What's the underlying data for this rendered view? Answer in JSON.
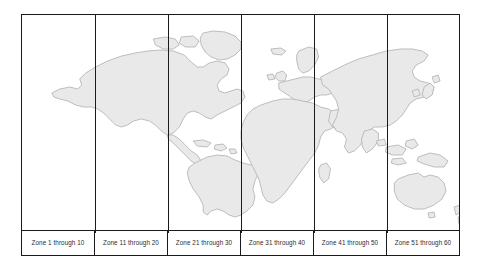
{
  "figure": {
    "name": "utm-zone-world-map",
    "frame_color": "#1a1a1a",
    "background_color": "#ffffff",
    "land_fill_color": "#e9e9e9",
    "land_stroke_color": "#b6b6b6",
    "label_text_color": "#2b2b2b"
  },
  "zones": [
    {
      "label": "Zone 1 through 10"
    },
    {
      "label": "Zone 11 through 20"
    },
    {
      "label": "Zone 21 through 30"
    },
    {
      "label": "Zone 31 through 40"
    },
    {
      "label": "Zone 41 through 50"
    },
    {
      "label": "Zone 51 through 60"
    }
  ],
  "landmasses": [
    {
      "name": "north-america"
    },
    {
      "name": "greenland"
    },
    {
      "name": "central-america"
    },
    {
      "name": "caribbean-islands"
    },
    {
      "name": "south-america"
    },
    {
      "name": "europe"
    },
    {
      "name": "british-isles"
    },
    {
      "name": "iceland"
    },
    {
      "name": "scandinavia"
    },
    {
      "name": "africa"
    },
    {
      "name": "madagascar"
    },
    {
      "name": "asia"
    },
    {
      "name": "japan"
    },
    {
      "name": "southeast-asia-islands"
    },
    {
      "name": "new-guinea"
    },
    {
      "name": "australia"
    },
    {
      "name": "new-zealand"
    }
  ]
}
